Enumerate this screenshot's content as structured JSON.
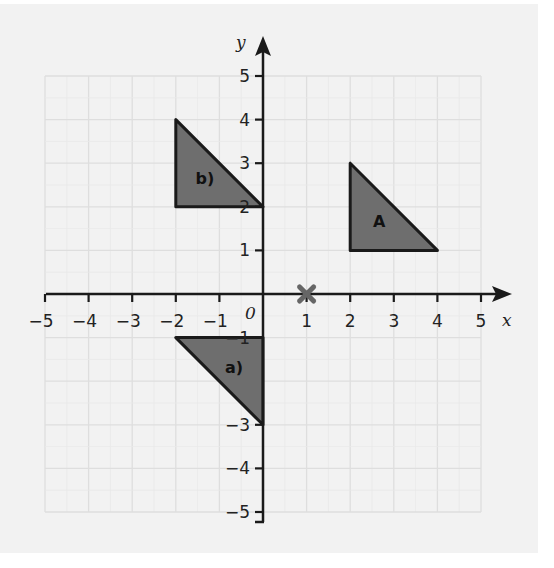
{
  "diagram": {
    "axes": {
      "x_label": "x",
      "y_label": "y",
      "origin_label": "0",
      "x_ticks": [
        "-5",
        "-4",
        "-3",
        "-2",
        "-1",
        "1",
        "2",
        "3",
        "4",
        "5"
      ],
      "y_ticks": [
        "5",
        "4",
        "3",
        "2",
        "1",
        "-1",
        "-3",
        "-4",
        "-5"
      ],
      "range": {
        "x": [
          -5,
          5
        ],
        "y": [
          -5,
          5
        ]
      }
    },
    "shapes": [
      {
        "label": "A",
        "vertices": [
          [
            2,
            3
          ],
          [
            2,
            1
          ],
          [
            4,
            1
          ]
        ]
      },
      {
        "label": "b)",
        "vertices": [
          [
            -2,
            4
          ],
          [
            -2,
            2
          ],
          [
            0,
            2
          ]
        ]
      },
      {
        "label": "a)",
        "vertices": [
          [
            -2,
            -1
          ],
          [
            0,
            -1
          ],
          [
            0,
            -3
          ]
        ]
      }
    ],
    "marker": {
      "type": "cross",
      "position": [
        1,
        0
      ]
    },
    "colors": {
      "background": "#f2f2f2",
      "grid": "#dedede",
      "axis": "#1a1a1a",
      "shape_fill": "#6e6e6e",
      "shape_stroke": "#1a1a1a",
      "marker": "#666666"
    }
  },
  "chart_data": {
    "type": "scatter",
    "title": "",
    "xlabel": "x",
    "ylabel": "y",
    "xlim": [
      -5,
      5
    ],
    "ylim": [
      -5,
      5
    ],
    "grid": true,
    "series": [
      {
        "name": "A",
        "points": [
          [
            2,
            3
          ],
          [
            2,
            1
          ],
          [
            4,
            1
          ]
        ]
      },
      {
        "name": "b)",
        "points": [
          [
            -2,
            4
          ],
          [
            -2,
            2
          ],
          [
            0,
            2
          ]
        ]
      },
      {
        "name": "a)",
        "points": [
          [
            -2,
            -1
          ],
          [
            0,
            -1
          ],
          [
            0,
            -3
          ]
        ]
      },
      {
        "name": "centre of rotation (cross)",
        "points": [
          [
            1,
            0
          ]
        ]
      }
    ]
  }
}
